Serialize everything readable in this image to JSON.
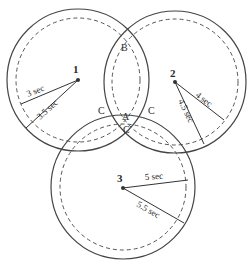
{
  "diagram": {
    "title": "",
    "circles": [
      {
        "id": "1",
        "label": "1",
        "cx": 78,
        "cy": 80,
        "outer_r": 71,
        "inner_r": 62,
        "inner_label": "3 sec",
        "outer_label": "3.5 sec"
      },
      {
        "id": "2",
        "label": "2",
        "cx": 175,
        "cy": 82,
        "outer_r": 71,
        "inner_r": 63,
        "inner_label": "4 sec",
        "outer_label": "4.5 sec"
      },
      {
        "id": "3",
        "label": "3",
        "cx": 123,
        "cy": 187,
        "outer_r": 72,
        "inner_r": 63,
        "inner_label": "5 sec",
        "outer_label": "5.5 sec"
      }
    ],
    "points": [
      {
        "label": "A"
      },
      {
        "label": "B"
      },
      {
        "label": "C"
      },
      {
        "label": "C"
      },
      {
        "label": "C"
      }
    ]
  }
}
